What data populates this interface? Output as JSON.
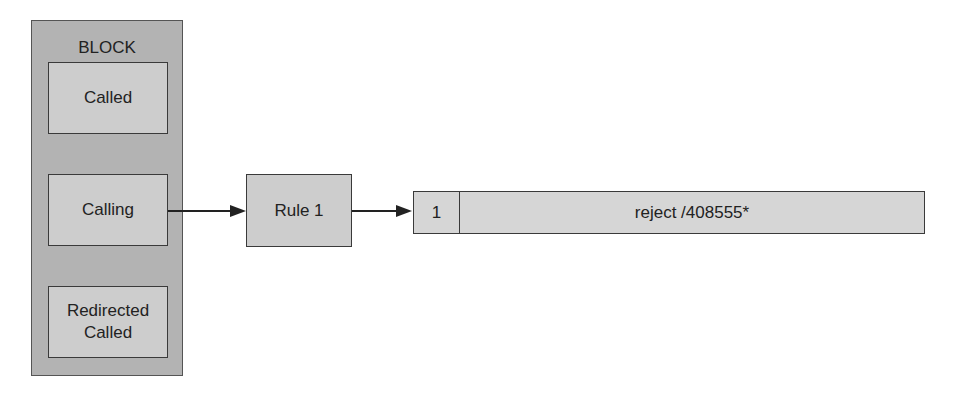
{
  "block": {
    "title": "BLOCK",
    "items": [
      {
        "label": "Called"
      },
      {
        "label": "Calling"
      },
      {
        "label": "Redirected\nCalled"
      }
    ]
  },
  "rule": {
    "label": "Rule 1"
  },
  "rule_entry": {
    "index": "1",
    "action": "reject /408555*"
  },
  "colors": {
    "block_fill": "#b3b3b3",
    "box_fill": "#cdcdcd",
    "border": "#3a3a3a"
  }
}
